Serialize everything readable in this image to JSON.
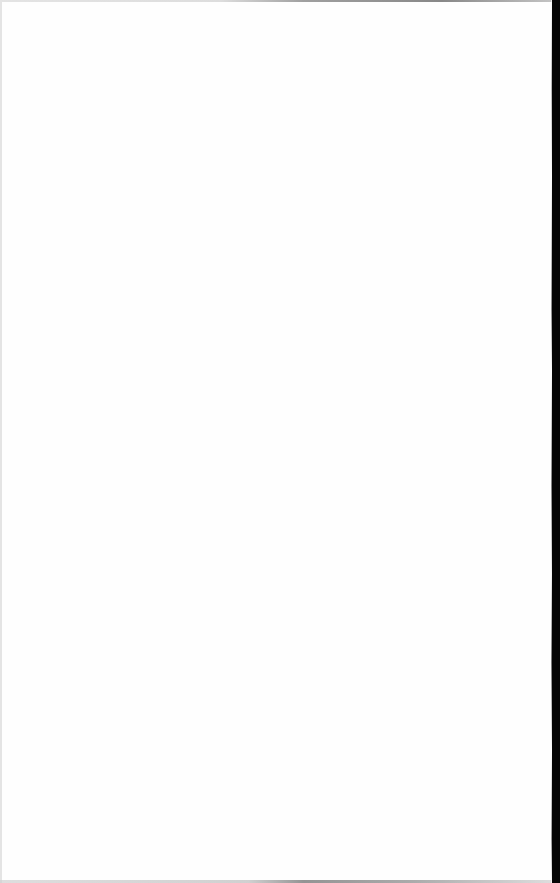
{
  "document": {
    "type": "scanned-page",
    "content": "",
    "colors": {
      "page": "#fefefe",
      "scanner_edge": "#060606",
      "border_shadow": "#d0d0d0"
    }
  }
}
